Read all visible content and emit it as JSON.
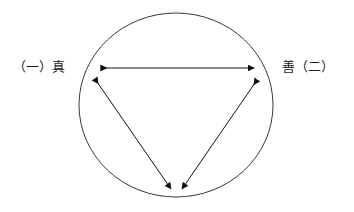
{
  "canvas": {
    "width": 354,
    "height": 212,
    "background": "#ffffff"
  },
  "colors": {
    "stroke": "#3a3a3a",
    "arrow": "#111111",
    "text": "#1a1a1a",
    "background": "#ffffff"
  },
  "diagram": {
    "type": "triad-relationship-circle",
    "circle": {
      "cx": 176,
      "cy": 105,
      "rx": 97,
      "ry": 92,
      "stroke_width": 1
    },
    "labels": {
      "left": "（一）真",
      "right": "善（二）",
      "bottom": ""
    },
    "vertices": [
      {
        "id": "left",
        "x": 97,
        "y": 72
      },
      {
        "id": "right",
        "x": 255,
        "y": 72
      },
      {
        "id": "bottom",
        "x": 176,
        "y": 189
      }
    ],
    "arrows": [
      {
        "id": "arrow-left-right",
        "from": "left",
        "to": "right",
        "double_headed": true,
        "x1": 101,
        "y1": 68,
        "x2": 254,
        "y2": 68
      },
      {
        "id": "arrow-left-bottom",
        "from": "left",
        "to": "bottom",
        "double_headed": true,
        "x1": 95,
        "y1": 79,
        "x2": 171,
        "y2": 189
      },
      {
        "id": "arrow-right-bottom",
        "from": "right",
        "to": "bottom",
        "double_headed": true,
        "x1": 257,
        "y1": 80,
        "x2": 182,
        "y2": 189
      }
    ]
  }
}
